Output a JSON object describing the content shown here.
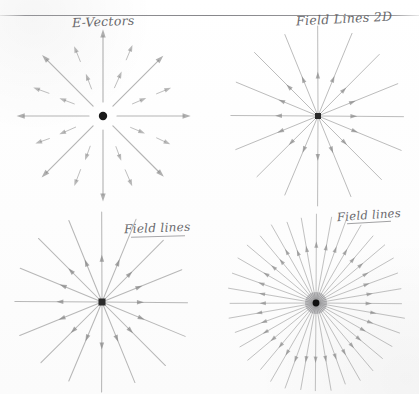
{
  "page": {
    "width": 419,
    "height": 394,
    "background_color": "#fefefe",
    "ink_color": "#5b5b60",
    "line_color": "#808080",
    "dot_color": "#1a1a1a",
    "horizontal_rule": {
      "y": 15,
      "color": "#6e6e73"
    }
  },
  "labels": {
    "top_left": "E-Vectors",
    "top_right": "Field Lines 2D",
    "bottom_left": "Field lines",
    "bottom_right": "Field lines"
  },
  "panels": [
    {
      "id": "e-vectors",
      "name": "E-Vectors",
      "label": "E-Vectors",
      "position": "top-left",
      "cx": 103,
      "cy": 116,
      "center_dot": {
        "shape": "circle",
        "radius": 4.2,
        "color": "#1a1a1a"
      },
      "style": "detached-arrows",
      "long_arrow_count": 8,
      "long_arrow_angles_deg": [
        0,
        45,
        90,
        135,
        180,
        225,
        270,
        315
      ],
      "long_arrow_inner_radius": 14,
      "long_arrow_outer_radius": 86,
      "short_arrow_count": 16,
      "short_arrow_angles_deg": [
        22.5,
        67.5,
        112.5,
        157.5,
        202.5,
        247.5,
        292.5,
        337.5
      ],
      "short_arrow_bands": [
        38,
        66
      ],
      "short_arrow_length": 14,
      "direction": "outward"
    },
    {
      "id": "field-lines-2d",
      "name": "Field Lines 2D",
      "label": "Field Lines 2D",
      "position": "top-right",
      "cx": 318,
      "cy": 116,
      "center_dot": {
        "shape": "square",
        "size": 6,
        "color": "#2a2a2a"
      },
      "style": "continuous-rays",
      "ray_count": 16,
      "ray_length": 88,
      "arrow_at_fraction": 0.42,
      "direction": "outward"
    },
    {
      "id": "field-lines-bl",
      "name": "Field lines",
      "label": "Field lines",
      "position": "bottom-left",
      "cx": 102,
      "cy": 302,
      "center_dot": {
        "shape": "square",
        "size": 7,
        "color": "#2a2a2a"
      },
      "style": "continuous-rays",
      "ray_count": 16,
      "ray_length": 88,
      "arrow_at_fraction": 0.45,
      "direction": "outward"
    },
    {
      "id": "field-lines-br",
      "name": "Field lines",
      "label": "Field lines",
      "position": "bottom-right",
      "cx": 316,
      "cy": 303,
      "center_dot": {
        "shape": "circle",
        "radius": 3.4,
        "color": "#111111"
      },
      "style": "dense-rays",
      "ray_count": 36,
      "ray_length": 88,
      "arrow_at_fraction": 0.62,
      "direction": "outward",
      "underlined_label": true
    }
  ]
}
